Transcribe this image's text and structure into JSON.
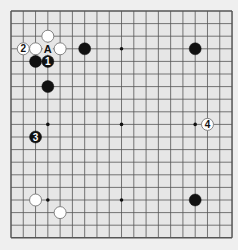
{
  "board": {
    "size": 19,
    "origin": {
      "x": 11,
      "y": 11
    },
    "spacing": {
      "x": 12.28,
      "y": 12.6
    },
    "colors": {
      "background": "#efefef",
      "board": "#e6e6e6",
      "line": "#555555",
      "black": "#111111",
      "white": "#ffffff",
      "white_edge": "#777777"
    },
    "star_points": [
      [
        4,
        4
      ],
      [
        10,
        4
      ],
      [
        16,
        4
      ],
      [
        4,
        10
      ],
      [
        10,
        10
      ],
      [
        16,
        10
      ],
      [
        4,
        16
      ],
      [
        10,
        16
      ],
      [
        16,
        16
      ]
    ],
    "stones": [
      {
        "color": "white",
        "col": 4,
        "row": 3,
        "label": ""
      },
      {
        "color": "white",
        "col": 2,
        "row": 4,
        "label": "2"
      },
      {
        "color": "white",
        "col": 3,
        "row": 4,
        "label": ""
      },
      {
        "color": "white",
        "col": 5,
        "row": 4,
        "label": ""
      },
      {
        "color": "black",
        "col": 3,
        "row": 5,
        "label": ""
      },
      {
        "color": "black",
        "col": 4,
        "row": 5,
        "label": "1"
      },
      {
        "color": "black",
        "col": 7,
        "row": 4,
        "label": ""
      },
      {
        "color": "black",
        "col": 16,
        "row": 4,
        "label": ""
      },
      {
        "color": "black",
        "col": 4,
        "row": 7,
        "label": ""
      },
      {
        "color": "black",
        "col": 3,
        "row": 11,
        "label": "3"
      },
      {
        "color": "white",
        "col": 17,
        "row": 10,
        "label": "4"
      },
      {
        "color": "white",
        "col": 3,
        "row": 16,
        "label": ""
      },
      {
        "color": "white",
        "col": 5,
        "row": 17,
        "label": ""
      },
      {
        "color": "black",
        "col": 16,
        "row": 16,
        "label": ""
      }
    ],
    "markers": [
      {
        "col": 4,
        "row": 4,
        "label": "A"
      }
    ]
  }
}
